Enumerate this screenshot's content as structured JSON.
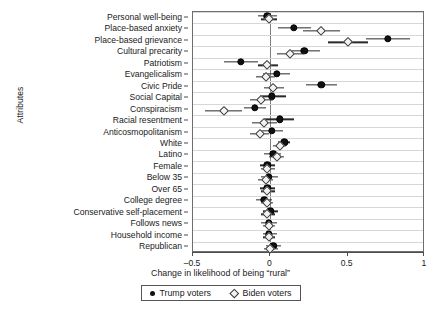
{
  "figure": {
    "yaxis_title": "Attributes",
    "xaxis_title": "Change in likelihood of being “rural”"
  },
  "legend": {
    "items": [
      {
        "label": "Trump voters",
        "marker": "filled-circle-icon",
        "color": "#111111"
      },
      {
        "label": "Biden voters",
        "marker": "open-diamond-icon",
        "color": "#f2f2f2"
      }
    ]
  },
  "chart_data": {
    "type": "scatter",
    "title": "",
    "subtitle": "",
    "xlabel": "Change in likelihood of being “rural”",
    "ylabel": "Attributes",
    "xlim": [
      -0.5,
      1.0
    ],
    "xticks": [
      -0.5,
      0,
      0.5,
      1
    ],
    "xticklabels": [
      "–0.5",
      "0",
      "0.5",
      "1"
    ],
    "grid": "horizontal",
    "legend_position": "below-axis",
    "zero_reference_line": 0,
    "categories": [
      "Personal well-being",
      "Place-based anxiety",
      "Place-based grievance",
      "Cultural precarity",
      "Patriotism",
      "Evangelicalism",
      "Civic Pride",
      "Social Capital",
      "Conspiracism",
      "Racial resentment",
      "Anticosmopolitanism",
      "White",
      "Latino",
      "Female",
      "Below 35",
      "Over 65",
      "College degree",
      "Conservative self-placement",
      "Follows news",
      "Household income",
      "Republican"
    ],
    "series": [
      {
        "name": "Trump voters",
        "marker": "filled-circle",
        "values": [
          -0.02,
          0.15,
          0.76,
          0.22,
          -0.19,
          0.04,
          0.33,
          0.01,
          -0.1,
          0.06,
          0.01,
          0.09,
          0.02,
          -0.02,
          -0.01,
          -0.02,
          -0.04,
          0.0,
          -0.01,
          -0.01,
          0.02
        ],
        "ci_low": [
          -0.08,
          0.05,
          0.62,
          0.12,
          -0.3,
          -0.05,
          0.23,
          -0.07,
          -0.17,
          -0.04,
          -0.06,
          0.05,
          -0.04,
          -0.07,
          -0.06,
          -0.07,
          -0.09,
          -0.05,
          -0.06,
          -0.05,
          -0.03
        ],
        "ci_high": [
          0.04,
          0.26,
          0.9,
          0.32,
          -0.08,
          0.13,
          0.43,
          0.1,
          -0.03,
          0.15,
          0.08,
          0.13,
          0.07,
          0.03,
          0.05,
          0.03,
          0.01,
          0.05,
          0.04,
          0.04,
          0.07
        ]
      },
      {
        "name": "Biden voters",
        "marker": "open-diamond",
        "values": [
          -0.01,
          0.33,
          0.5,
          0.13,
          -0.02,
          -0.03,
          0.02,
          -0.06,
          -0.3,
          -0.04,
          -0.07,
          0.06,
          0.04,
          -0.02,
          -0.03,
          -0.02,
          -0.02,
          -0.02,
          -0.01,
          -0.01,
          0.0
        ],
        "ci_low": [
          -0.06,
          0.21,
          0.37,
          0.04,
          -0.08,
          -0.09,
          -0.04,
          -0.13,
          -0.42,
          -0.12,
          -0.13,
          0.02,
          -0.01,
          -0.06,
          -0.08,
          -0.06,
          -0.06,
          -0.06,
          -0.05,
          -0.05,
          -0.04
        ],
        "ci_high": [
          0.04,
          0.45,
          0.63,
          0.22,
          0.05,
          0.03,
          0.09,
          0.02,
          -0.18,
          0.04,
          -0.01,
          0.1,
          0.09,
          0.03,
          0.02,
          0.03,
          0.02,
          0.03,
          0.03,
          0.03,
          0.05
        ]
      }
    ]
  }
}
